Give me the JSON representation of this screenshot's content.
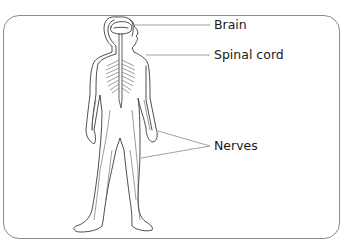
{
  "diagram": {
    "labels": [
      {
        "id": "brain",
        "text": "Brain"
      },
      {
        "id": "spinal_cord",
        "text": "Spinal cord"
      },
      {
        "id": "nerves",
        "text": "Nerves"
      }
    ]
  },
  "colors": {
    "frame": "#8a8a8a",
    "outline": "#3a3a3a",
    "leader": "#8a8a8a",
    "text": "#1a1a1a"
  }
}
